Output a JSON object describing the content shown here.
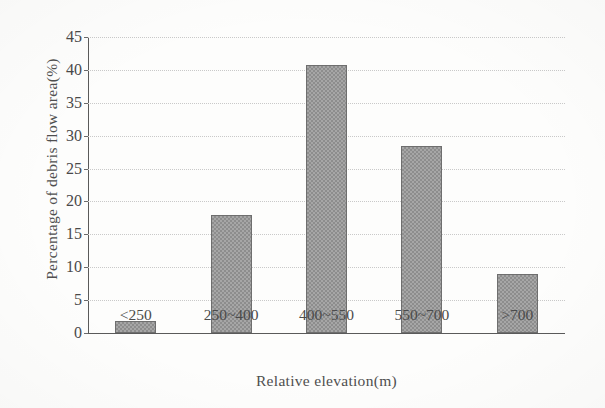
{
  "chart_data": {
    "type": "bar",
    "title": "",
    "subtitle": "",
    "xlabel": "Relative elevation(m)",
    "ylabel": "Percentage of debris flow area(%)",
    "categories": [
      "<250",
      "250~400",
      "400~550",
      "550~700",
      ">700"
    ],
    "values": [
      1.8,
      18.0,
      40.7,
      28.4,
      8.9
    ],
    "series": [
      {
        "name": "Percentage of debris flow area",
        "values": [
          1.8,
          18.0,
          40.7,
          28.4,
          8.9
        ]
      }
    ],
    "ylim": [
      0,
      45
    ],
    "ytick_labels": [
      "0",
      "5",
      "10",
      "15",
      "20",
      "25",
      "30",
      "35",
      "40",
      "45"
    ],
    "ytick_values": [
      0,
      5,
      10,
      15,
      20,
      25,
      30,
      35,
      40,
      45
    ],
    "grid": true,
    "grid_axis": "y",
    "grid_style": "dotted",
    "legend": false,
    "legend_position": "none",
    "bar_fill_color": "#a6a6a6",
    "bar_edge_color": "#6e6e6e",
    "axis_color": "#5a5a5a",
    "gridline_color": "#c9c9c9",
    "background_color": "#fdfdfc",
    "text_color": "#4a4a4a"
  }
}
